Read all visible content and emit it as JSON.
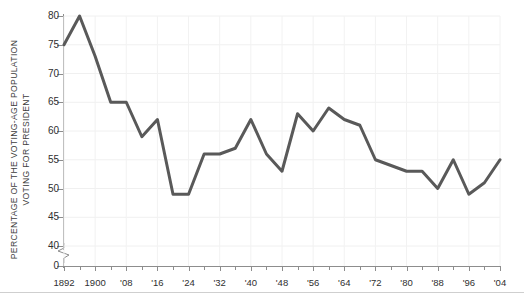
{
  "axes": {
    "ylabel_line1": "PERCENTAGE OF THE VOTING-AGE POPULATION",
    "ylabel_line2": "VOTING FOR PRESIDENT"
  },
  "chart_data": {
    "type": "line",
    "title": "",
    "xlabel": "",
    "ylabel": "PERCENTAGE OF THE VOTING-AGE POPULATION VOTING FOR PRESIDENT",
    "ylim": [
      38,
      81
    ],
    "ytick_values": [
      0,
      40,
      45,
      50,
      55,
      60,
      65,
      70,
      75,
      80
    ],
    "ytick_labels": [
      "0",
      "40",
      "45",
      "50",
      "55",
      "60",
      "65",
      "70",
      "75",
      "80"
    ],
    "y_axis_break": true,
    "y_axis_break_between": [
      0,
      40
    ],
    "xlim": [
      1892,
      2004
    ],
    "xtick_values": [
      1892,
      1900,
      1908,
      1916,
      1924,
      1932,
      1940,
      1948,
      1956,
      1964,
      1972,
      1980,
      1988,
      1996,
      2004
    ],
    "xtick_labels": [
      "1892",
      "1900",
      "'08",
      "'16",
      "'24",
      "'32",
      "'40",
      "'48",
      "'56",
      "'64",
      "'72",
      "'80",
      "'88",
      "'96",
      "'04"
    ],
    "xtick_minor_step": 4,
    "grid": true,
    "grid_color": "#f0f0f0",
    "legend": null,
    "line_color": "#595959",
    "line_width": 3,
    "background": "#ffffff",
    "x": [
      1892,
      1896,
      1900,
      1904,
      1908,
      1912,
      1916,
      1920,
      1924,
      1928,
      1932,
      1936,
      1940,
      1944,
      1948,
      1952,
      1956,
      1960,
      1964,
      1968,
      1972,
      1976,
      1980,
      1984,
      1988,
      1992,
      1996,
      2000,
      2004
    ],
    "values": [
      75,
      80,
      73,
      65,
      65,
      59,
      62,
      49,
      49,
      56,
      56,
      57,
      62,
      56,
      53,
      63,
      60,
      64,
      62,
      61,
      55,
      54,
      53,
      53,
      50,
      55,
      49,
      51,
      55
    ],
    "series": [
      {
        "name": "Voter turnout",
        "values": [
          75,
          80,
          73,
          65,
          65,
          59,
          62,
          49,
          49,
          56,
          56,
          57,
          62,
          56,
          53,
          63,
          60,
          64,
          62,
          61,
          55,
          54,
          53,
          53,
          50,
          55,
          49,
          51,
          55
        ]
      }
    ]
  }
}
